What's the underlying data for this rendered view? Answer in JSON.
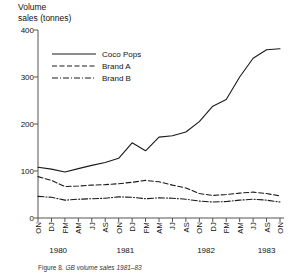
{
  "figure": {
    "caption_prefix": "Figure 8.",
    "caption_title": "GB volume sales 1981–83"
  },
  "chart_data": {
    "type": "line",
    "title": "",
    "ylabel": "Volume\nsales (tonnes)",
    "xlabel": "",
    "ylim": [
      0,
      400
    ],
    "yticks": [
      0,
      100,
      200,
      300,
      400
    ],
    "grid": false,
    "legend_position": "top-left-inside",
    "categories": [
      "ON",
      "DJ",
      "FM",
      "AM",
      "JJ",
      "AS",
      "ON",
      "DJ",
      "FM",
      "AM",
      "JJ",
      "AS",
      "ON",
      "DJ",
      "FM",
      "AM",
      "JJ",
      "AS",
      "ON"
    ],
    "year_groups": [
      {
        "label": "1980",
        "start_index": 0,
        "end_index": 3
      },
      {
        "label": "1981",
        "start_index": 4,
        "end_index": 9
      },
      {
        "label": "1982",
        "start_index": 10,
        "end_index": 15
      },
      {
        "label": "1983",
        "start_index": 16,
        "end_index": 18
      }
    ],
    "series": [
      {
        "name": "Coco Pops",
        "style": "solid",
        "color": "#1a1a1a",
        "values": [
          108,
          104,
          98,
          105,
          112,
          118,
          127,
          160,
          143,
          172,
          175,
          183,
          205,
          238,
          252,
          300,
          340,
          358,
          360
        ]
      },
      {
        "name": "Brand A",
        "style": "dashed",
        "color": "#1a1a1a",
        "values": [
          88,
          80,
          67,
          68,
          70,
          71,
          73,
          76,
          80,
          77,
          70,
          64,
          52,
          48,
          50,
          53,
          55,
          52,
          47
        ]
      },
      {
        "name": "Brand B",
        "style": "dashdot",
        "color": "#1a1a1a",
        "values": [
          46,
          44,
          38,
          40,
          41,
          42,
          45,
          44,
          41,
          43,
          42,
          40,
          36,
          34,
          35,
          38,
          40,
          38,
          34
        ]
      }
    ]
  }
}
